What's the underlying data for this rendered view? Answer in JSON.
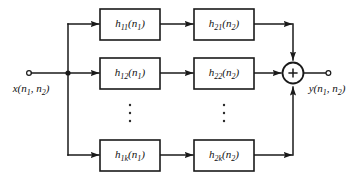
{
  "diagram": {
    "type": "block-diagram",
    "input": {
      "label": "x(n1, n2)",
      "var": "x",
      "sub1": "1",
      "sub2": "2",
      "terminal": "open-circle"
    },
    "output": {
      "label": "y(n1, n2)",
      "var": "y",
      "sub1": "1",
      "sub2": "2",
      "terminal": "open-circle"
    },
    "summing_node": {
      "symbol": "+",
      "name": "adder"
    },
    "ellipsis": {
      "glyph": "vertical-dots",
      "count": 3
    },
    "branches": [
      {
        "index": 1,
        "stage1": {
          "var": "h",
          "sub": "11",
          "arg": "n",
          "arg_sub": "1",
          "label": "h11(n1)"
        },
        "stage2": {
          "var": "h",
          "sub": "21",
          "arg": "n",
          "arg_sub": "2",
          "label": "h21(n2)"
        }
      },
      {
        "index": 2,
        "stage1": {
          "var": "h",
          "sub": "12",
          "arg": "n",
          "arg_sub": "1",
          "label": "h12(n1)"
        },
        "stage2": {
          "var": "h",
          "sub": "22",
          "arg": "n",
          "arg_sub": "2",
          "label": "h22(n2)"
        }
      },
      {
        "index": 3,
        "stage1": {
          "var": "h",
          "sub": "1k",
          "arg": "n",
          "arg_sub": "1",
          "label": "h1k(n1)"
        },
        "stage2": {
          "var": "h",
          "sub": "2k",
          "arg": "n",
          "arg_sub": "2",
          "label": "h2k(n2)"
        }
      }
    ],
    "colors": {
      "line": "#1a1a1a",
      "background": "#ffffff",
      "text": "#111111"
    }
  }
}
